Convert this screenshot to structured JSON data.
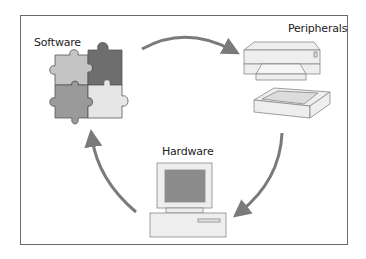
{
  "diagram": {
    "type": "cycle",
    "nodes": [
      {
        "id": "software",
        "label": "Software",
        "icon": "puzzle-pieces-icon"
      },
      {
        "id": "peripherals",
        "label": "Peripherals",
        "icon": "printer-scanner-icon"
      },
      {
        "id": "hardware",
        "label": "Hardware",
        "icon": "desktop-computer-icon"
      }
    ],
    "edges": [
      {
        "from": "software",
        "to": "peripherals"
      },
      {
        "from": "peripherals",
        "to": "hardware"
      },
      {
        "from": "hardware",
        "to": "software"
      }
    ],
    "colors": {
      "arrow": "#7a7a7a",
      "frame": "#6a6a6a",
      "puzzle_light": "#c4c4c4",
      "puzzle_dark": "#6e6e6e",
      "puzzle_mid": "#9a9a9a",
      "puzzle_pale": "#e6e6e6",
      "monitor_screen": "#8c8c8c",
      "device_body": "#eeeeee"
    }
  }
}
